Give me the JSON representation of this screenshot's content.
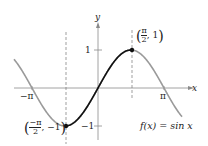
{
  "function_label": "f(x) = sin x",
  "axes": {
    "x_label": "x",
    "y_label": "y",
    "x_ticks": [
      {
        "label": "−π",
        "value": -3.14159
      },
      {
        "label": "π",
        "value": 3.14159
      }
    ],
    "y_ticks": [
      {
        "label": "1",
        "value": 1
      },
      {
        "label": "−1",
        "value": -1
      }
    ]
  },
  "points": [
    {
      "label": "(π/2, 1)",
      "x_text": "π",
      "x_den": "2",
      "y_text": "1"
    },
    {
      "label": "(−π/2, −1)",
      "x_text": "−π",
      "x_den": "2",
      "y_text": "−1"
    }
  ],
  "colors": {
    "highlight": "#111111",
    "curve": "#9a9a9a",
    "axis": "#8a8a8a"
  }
}
